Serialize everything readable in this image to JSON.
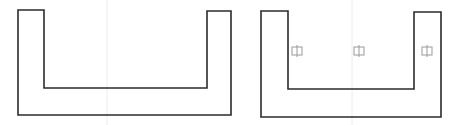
{
  "diagram": {
    "title": "",
    "colors": {
      "outline": "#2b2b2b",
      "marker": "#9a9a9a",
      "centerline": "#ececec",
      "background": "#ffffff"
    },
    "shapes": [
      {
        "id": "u-channel-left",
        "type": "u-profile",
        "points": [
          [
            18,
            10
          ],
          [
            44,
            10
          ],
          [
            44,
            88
          ],
          [
            207,
            88
          ],
          [
            207,
            11
          ],
          [
            231,
            11
          ],
          [
            231,
            115
          ],
          [
            18,
            115
          ]
        ],
        "centerline_x": 107,
        "markers": []
      },
      {
        "id": "u-channel-right",
        "type": "u-profile",
        "points": [
          [
            261,
            11
          ],
          [
            288,
            11
          ],
          [
            288,
            89
          ],
          [
            414,
            89
          ],
          [
            414,
            12
          ],
          [
            441,
            12
          ],
          [
            441,
            117
          ],
          [
            261,
            117
          ]
        ],
        "centerline_x": 352,
        "markers": [
          {
            "icon": "phi-marker-icon",
            "x": 297,
            "y": 51
          },
          {
            "icon": "phi-marker-icon",
            "x": 359,
            "y": 51
          },
          {
            "icon": "phi-marker-icon",
            "x": 427,
            "y": 51
          }
        ]
      }
    ]
  }
}
